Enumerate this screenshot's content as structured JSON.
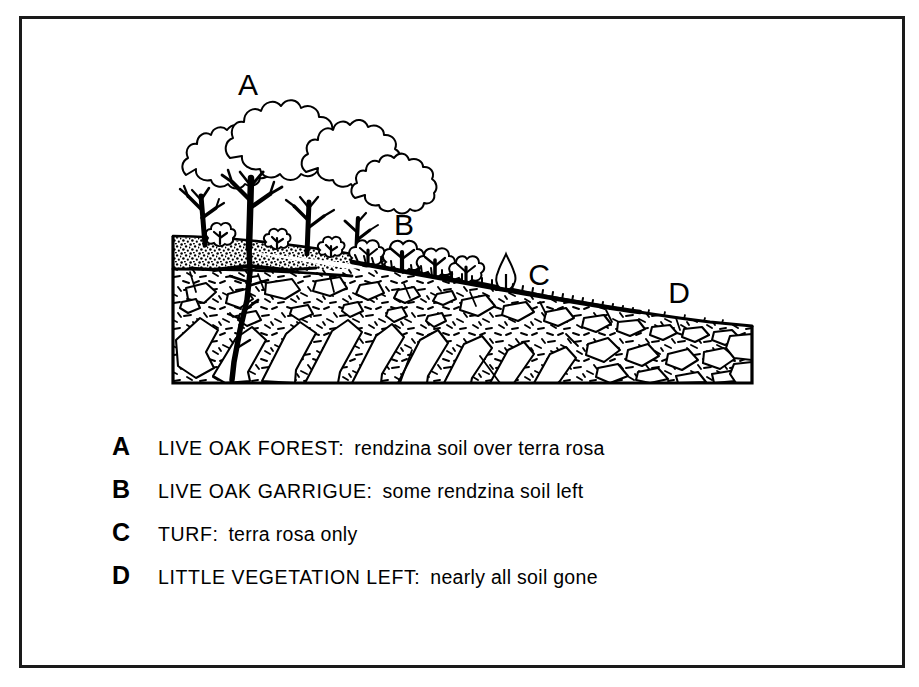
{
  "figure": {
    "background_color": "#ffffff",
    "frame_color": "#1a1a1a",
    "ink_color": "#000000"
  },
  "diagram": {
    "zone_labels": [
      {
        "key": "A",
        "x": 248,
        "y": 95
      },
      {
        "key": "B",
        "x": 404,
        "y": 235
      },
      {
        "key": "C",
        "x": 539,
        "y": 285
      },
      {
        "key": "D",
        "x": 679,
        "y": 303
      }
    ],
    "layers": [
      {
        "name": "rendzina-soil",
        "pattern": "stipple",
        "label": "rendzina soil"
      },
      {
        "name": "terra-rosa",
        "pattern": "short-dash",
        "label": "terra rosa"
      },
      {
        "name": "limestone-bedrock",
        "pattern": "white-blocks",
        "label": "limestone"
      }
    ],
    "vegetation": [
      {
        "name": "live-oak-trees",
        "zone": "A"
      },
      {
        "name": "garrigue-shrubs",
        "zone": "B"
      },
      {
        "name": "turf",
        "zone": "C"
      },
      {
        "name": "bare-rock",
        "zone": "D"
      }
    ]
  },
  "legend": {
    "rows": [
      {
        "key": "A",
        "term": "LIVE OAK FOREST:",
        "desc": "rendzina soil over terra rosa"
      },
      {
        "key": "B",
        "term": "LIVE OAK GARRIGUE:",
        "desc": "some rendzina soil left"
      },
      {
        "key": "C",
        "term": "TURF:",
        "desc": "terra rosa only"
      },
      {
        "key": "D",
        "term": "LITTLE VEGETATION LEFT:",
        "desc": "nearly all soil gone"
      }
    ]
  }
}
